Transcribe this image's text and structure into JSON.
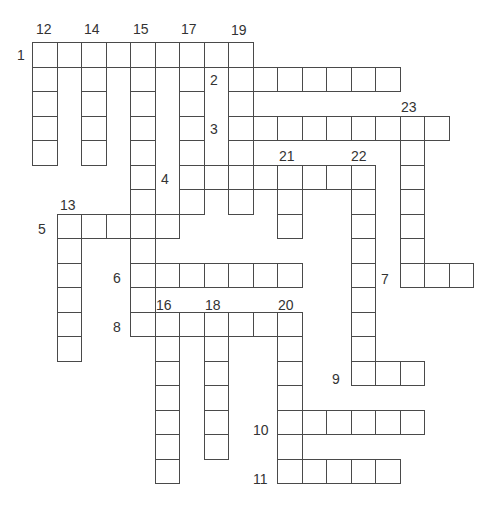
{
  "puzzle": {
    "title": "Crossword",
    "grid": {
      "origin_x": 32,
      "origin_y": 42,
      "cell_size": 24.5
    },
    "across": [
      {
        "number": "1",
        "row": 0,
        "col": 0,
        "length": 9
      },
      {
        "number": "2",
        "row": 1,
        "col": 8,
        "length": 7
      },
      {
        "number": "3",
        "row": 3,
        "col": 8,
        "length": 9
      },
      {
        "number": "4",
        "row": 5,
        "col": 6,
        "length": 8
      },
      {
        "number": "5",
        "row": 7,
        "col": 1,
        "length": 5
      },
      {
        "number": "6",
        "row": 9,
        "col": 4,
        "length": 7
      },
      {
        "number": "7",
        "row": 9,
        "col": 15,
        "length": 3
      },
      {
        "number": "8",
        "row": 11,
        "col": 4,
        "length": 7
      },
      {
        "number": "9",
        "row": 13,
        "col": 13,
        "length": 3
      },
      {
        "number": "10",
        "row": 15,
        "col": 10,
        "length": 6
      },
      {
        "number": "11",
        "row": 17,
        "col": 10,
        "length": 5
      }
    ],
    "down": [
      {
        "number": "12",
        "row": 0,
        "col": 0,
        "length": 5
      },
      {
        "number": "13",
        "row": 7,
        "col": 1,
        "length": 6
      },
      {
        "number": "14",
        "row": 0,
        "col": 2,
        "length": 5
      },
      {
        "number": "15",
        "row": 0,
        "col": 4,
        "length": 12
      },
      {
        "number": "16",
        "row": 11,
        "col": 5,
        "length": 7
      },
      {
        "number": "17",
        "row": 0,
        "col": 6,
        "length": 7
      },
      {
        "number": "18",
        "row": 11,
        "col": 7,
        "length": 6
      },
      {
        "number": "19",
        "row": 0,
        "col": 8,
        "length": 7
      },
      {
        "number": "20",
        "row": 11,
        "col": 10,
        "length": 7
      },
      {
        "number": "21",
        "row": 5,
        "col": 10,
        "length": 3
      },
      {
        "number": "22",
        "row": 5,
        "col": 13,
        "length": 9
      },
      {
        "number": "23",
        "row": 3,
        "col": 15,
        "length": 7
      }
    ],
    "labels": [
      {
        "text": "1",
        "x": 17,
        "y": 48
      },
      {
        "text": "2",
        "x": 210,
        "y": 73
      },
      {
        "text": "3",
        "x": 210,
        "y": 122
      },
      {
        "text": "4",
        "x": 161,
        "y": 172
      },
      {
        "text": "5",
        "x": 38,
        "y": 222
      },
      {
        "text": "6",
        "x": 113,
        "y": 271
      },
      {
        "text": "7",
        "x": 381,
        "y": 272
      },
      {
        "text": "8",
        "x": 113,
        "y": 320
      },
      {
        "text": "9",
        "x": 332,
        "y": 372
      },
      {
        "text": "10",
        "x": 253,
        "y": 423
      },
      {
        "text": "11",
        "x": 253,
        "y": 472
      },
      {
        "text": "12",
        "x": 36,
        "y": 22
      },
      {
        "text": "13",
        "x": 60,
        "y": 198
      },
      {
        "text": "14",
        "x": 84,
        "y": 22
      },
      {
        "text": "15",
        "x": 133,
        "y": 22
      },
      {
        "text": "16",
        "x": 156,
        "y": 298
      },
      {
        "text": "17",
        "x": 181,
        "y": 22
      },
      {
        "text": "18",
        "x": 205,
        "y": 298
      },
      {
        "text": "19",
        "x": 231,
        "y": 23
      },
      {
        "text": "20",
        "x": 278,
        "y": 298
      },
      {
        "text": "21",
        "x": 279,
        "y": 149
      },
      {
        "text": "22",
        "x": 351,
        "y": 149
      },
      {
        "text": "23",
        "x": 401,
        "y": 100
      }
    ]
  }
}
